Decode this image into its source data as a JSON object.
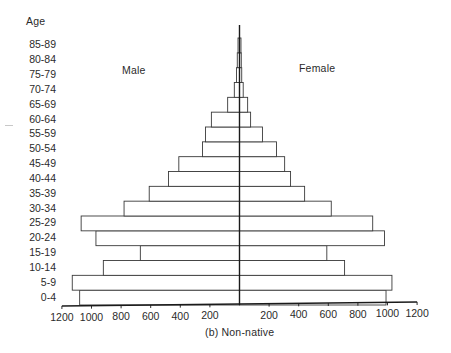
{
  "chart_data": {
    "type": "bar",
    "subtype": "population_pyramid",
    "title": "(b) Non-native",
    "y_axis_title": "Age",
    "xlabel": "",
    "left_series_label": "Male",
    "right_series_label": "Female",
    "categories": [
      "0-4",
      "5-9",
      "10-14",
      "15-19",
      "20-24",
      "25-29",
      "30-34",
      "35-39",
      "40-44",
      "45-49",
      "50-54",
      "55-59",
      "60-64",
      "65-69",
      "70-74",
      "75-79",
      "80-84",
      "85-89"
    ],
    "series": [
      {
        "name": "Male",
        "side": "left",
        "values": [
          1080,
          1130,
          920,
          670,
          970,
          1070,
          780,
          610,
          480,
          410,
          250,
          230,
          190,
          80,
          35,
          20,
          15,
          10
        ]
      },
      {
        "name": "Female",
        "side": "right",
        "values": [
          990,
          1030,
          710,
          590,
          980,
          900,
          620,
          440,
          345,
          305,
          250,
          155,
          75,
          55,
          25,
          15,
          12,
          10
        ]
      }
    ],
    "x_ticks_left": [
      "1200",
      "1000",
      "800",
      "600",
      "400",
      "200"
    ],
    "x_ticks_right": [
      "200",
      "400",
      "600",
      "800",
      "1000",
      "1200"
    ],
    "xlim": [
      -1200,
      1200
    ],
    "grid": false,
    "legend": "inline labels"
  },
  "labels": {
    "age_title": "Age",
    "male": "Male",
    "female": "Female",
    "caption": "(b) Non-native"
  },
  "style": {
    "line_color": "#3a3a3a",
    "axis_color": "#1a1a1a",
    "bar_fill": "#ffffff"
  }
}
